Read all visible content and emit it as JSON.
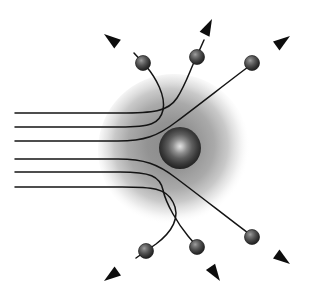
{
  "figure": {
    "background_color": "#ffffff",
    "canvas": {
      "width": 318,
      "height": 301
    }
  },
  "atom_cloud": {
    "label": "electron-cloud",
    "center": {
      "x": 174,
      "y": 150
    },
    "radius": 74,
    "core_color": "#8c8c8c",
    "mid_color": "#a8a8a8",
    "edge_color": "#ffffff"
  },
  "nucleus": {
    "label": "nucleus",
    "center": {
      "x": 180,
      "y": 148
    },
    "radius": 21,
    "highlight_color": "#d8d8d8",
    "body_color": "#3a3a3a",
    "rim_color": "#1a1a1a",
    "highlight_offset": {
      "x": 182,
      "y": 146
    }
  },
  "style": {
    "line_color": "#141414",
    "line_width": 1.5,
    "arrow_color": "#0d0d0d",
    "particle_body_color": "#4a4a4a",
    "particle_rim_color": "#1c1c1c",
    "particle_highlight_color": "#8f8f8f",
    "particle_radius": 7.5
  },
  "beam": {
    "label": "incident-alpha-particle-beam",
    "direction": "left-to-right",
    "entry_x": 15,
    "count": 6,
    "impact_parameters_y": [
      113,
      127,
      141,
      159,
      172,
      187
    ]
  },
  "trajectories": [
    {
      "id": "traj-1",
      "name": "trajectory-upper-large-deflection",
      "impact_y": 113,
      "deflection": "large-upward",
      "path": "M15,113 L120,113 C152,113 168,112 177,98 C186,84 190,70 196,58 L204,40",
      "particle": {
        "x": 197,
        "y": 57
      },
      "arrow": {
        "tip_x": 212,
        "tip_y": 19,
        "angle_deg": -64
      }
    },
    {
      "id": "traj-2",
      "name": "trajectory-upper-medium-deflection",
      "impact_y": 127,
      "deflection": "medium-upward",
      "path": "M15,127 L120,127 C150,127 160,124 163,110 C166,96 156,78 146,66 L134,53",
      "particle": {
        "x": 143,
        "y": 63
      },
      "arrow": {
        "tip_x": 104,
        "tip_y": 34,
        "angle_deg": -143
      }
    },
    {
      "id": "traj-3",
      "name": "trajectory-upper-small-deflection",
      "impact_y": 141,
      "deflection": "small-upward",
      "path": "M15,141 L118,141 C144,141 158,136 176,122 C200,104 228,82 248,67",
      "particle": {
        "x": 252,
        "y": 63
      },
      "arrow": {
        "tip_x": 290,
        "tip_y": 36,
        "angle_deg": -36
      }
    },
    {
      "id": "traj-4",
      "name": "trajectory-lower-small-deflection",
      "impact_y": 159,
      "deflection": "small-downward",
      "path": "M15,159 L118,159 C144,159 158,164 176,178 C200,196 228,218 248,233",
      "particle": {
        "x": 252,
        "y": 237
      },
      "arrow": {
        "tip_x": 290,
        "tip_y": 264,
        "angle_deg": 36
      }
    },
    {
      "id": "traj-5",
      "name": "trajectory-lower-medium-deflection",
      "impact_y": 172,
      "deflection": "medium-downward",
      "path": "M15,172 L120,172 C150,172 160,176 163,190 C166,204 178,224 188,236 L199,249",
      "particle": {
        "x": 197,
        "y": 247
      },
      "arrow": {
        "tip_x": 220,
        "tip_y": 281,
        "angle_deg": 56
      }
    },
    {
      "id": "traj-6",
      "name": "trajectory-lower-large-deflection",
      "impact_y": 187,
      "deflection": "large-downward",
      "path": "M15,187 L122,187 C152,187 166,188 173,202 C181,217 172,232 156,244 L136,258",
      "particle": {
        "x": 146,
        "y": 251
      },
      "arrow": {
        "tip_x": 104,
        "tip_y": 281,
        "angle_deg": 144
      }
    }
  ],
  "particles": [
    {
      "name": "scattered-particle-upper-left",
      "x": 143,
      "y": 63
    },
    {
      "name": "scattered-particle-upper-middle",
      "x": 197,
      "y": 57
    },
    {
      "name": "scattered-particle-upper-right",
      "x": 252,
      "y": 63
    },
    {
      "name": "scattered-particle-lower-left",
      "x": 146,
      "y": 251
    },
    {
      "name": "scattered-particle-lower-middle",
      "x": 197,
      "y": 247
    },
    {
      "name": "scattered-particle-lower-right",
      "x": 252,
      "y": 237
    }
  ],
  "chart_data": {
    "type": "scatter",
    "xlabel": "",
    "ylabel": "",
    "xlim": [
      0,
      318
    ],
    "ylim": [
      0,
      301
    ],
    "grid": false,
    "legend": "none",
    "annotations": [
      "Six parallel incident alpha-particle trajectories enter from the left edge",
      "Trajectories bend hyperbolically around the dense central nucleus",
      "Deflection angle increases as the impact parameter decreases",
      "Diffuse gray sphere represents the atom's electron cloud",
      "Small dark solid sphere at the center represents the nucleus"
    ],
    "series": [
      {
        "name": "incident-beam-impact-parameters",
        "x": [
          15,
          15,
          15,
          15,
          15,
          15
        ],
        "y": [
          113,
          127,
          141,
          159,
          172,
          187
        ]
      },
      {
        "name": "scattered-particle-positions",
        "x": [
          143,
          197,
          252,
          146,
          197,
          252
        ],
        "y": [
          63,
          57,
          63,
          251,
          247,
          237
        ]
      },
      {
        "name": "exit-arrow-tips",
        "x": [
          104,
          212,
          290,
          104,
          220,
          290
        ],
        "y": [
          34,
          19,
          36,
          281,
          281,
          264
        ]
      }
    ]
  }
}
